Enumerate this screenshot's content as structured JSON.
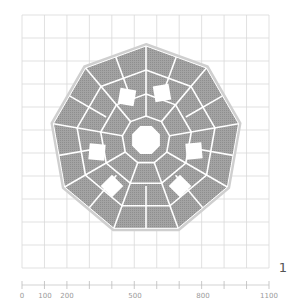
{
  "figure": {
    "label": "1",
    "shape": "nonagon",
    "sides": 9,
    "fill_color": "#9c9c9c",
    "seam_color": "#ffffff",
    "grid_color": "#d6d6d6",
    "holes": {
      "center": "octagon",
      "ring": [
        "top-left-square",
        "top-right-square",
        "left-square",
        "right-square",
        "bottom-left-diamond",
        "bottom-right-diamond"
      ]
    }
  },
  "grid": {
    "columns": 11,
    "rows": 11
  },
  "ruler": {
    "labels": [
      "0",
      "100",
      "200",
      "500",
      "800",
      "1100"
    ],
    "tick_positions": [
      0,
      100,
      200,
      300,
      400,
      500,
      600,
      700,
      800,
      900,
      1000,
      1100
    ]
  }
}
